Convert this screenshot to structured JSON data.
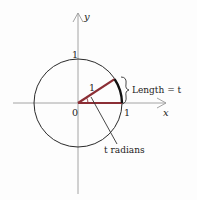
{
  "diagram": {
    "axes": {
      "x_label": "x",
      "y_label": "y",
      "origin_label": "0",
      "x_tick_label": "1",
      "y_tick_label": "1"
    },
    "radius_label": "1",
    "arc_label": "Length = t",
    "angle_label": "t radians",
    "colors": {
      "axis": "#9a9a9a",
      "circle": "#2a2a2a",
      "radius": "#8b2e35",
      "arc": "#111111",
      "text": "#222222"
    }
  }
}
